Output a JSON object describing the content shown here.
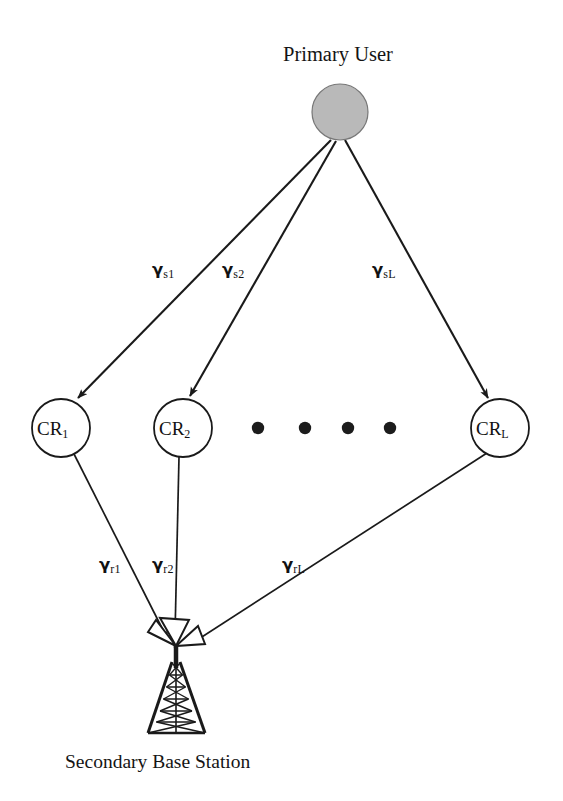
{
  "figure": {
    "title": "Primary User",
    "caption": "Secondary Base Station",
    "background_color": "#ffffff",
    "line_color": "#1a1a1a",
    "primary_user_fill": "#b9b9b9"
  },
  "nodes": {
    "primary_user": {
      "label": "Primary User",
      "shape": "filled-circle",
      "cx": 340,
      "cy": 112,
      "r": 28,
      "fill": "#b9b9b9"
    },
    "relays": [
      {
        "name": "CR1",
        "prefix": "CR",
        "subscript": "1",
        "cx": 61,
        "cy": 428,
        "r": 29
      },
      {
        "name": "CR2",
        "prefix": "CR",
        "subscript": "2",
        "cx": 183,
        "cy": 428,
        "r": 29
      },
      {
        "name": "CRL",
        "prefix": "CR",
        "subscript": "L",
        "cx": 500,
        "cy": 428,
        "r": 29
      }
    ],
    "base_station": {
      "label": "Secondary Base Station",
      "shape": "lattice-tower-with-horn-antennas",
      "apex_x": 176,
      "apex_y": 645,
      "base_y": 733
    },
    "ellipsis": {
      "dots": 4,
      "positions": [
        258,
        305,
        348,
        390
      ],
      "cy": 428,
      "r": 6
    }
  },
  "links": {
    "source_to_relay": [
      {
        "name": "gamma-s1",
        "gamma": "γ",
        "subscript": "s1",
        "from": "primary_user",
        "to": "CR1",
        "label_x": 152,
        "label_y": 262
      },
      {
        "name": "gamma-s2",
        "gamma": "γ",
        "subscript": "s2",
        "from": "primary_user",
        "to": "CR2",
        "label_x": 222,
        "label_y": 262
      },
      {
        "name": "gamma-sL",
        "gamma": "γ",
        "subscript": "sL",
        "from": "primary_user",
        "to": "CRL",
        "label_x": 372,
        "label_y": 262
      }
    ],
    "relay_to_base": [
      {
        "name": "gamma-r1",
        "gamma": "γ",
        "subscript": "r1",
        "from": "CR1",
        "to": "base_station",
        "label_x": 99,
        "label_y": 557
      },
      {
        "name": "gamma-r2",
        "gamma": "γ",
        "subscript": "r2",
        "from": "CR2",
        "to": "base_station",
        "label_x": 152,
        "label_y": 557
      },
      {
        "name": "gamma-rL",
        "gamma": "γ",
        "subscript": "rL",
        "from": "CRL",
        "to": "base_station",
        "label_x": 282,
        "label_y": 557
      }
    ]
  }
}
